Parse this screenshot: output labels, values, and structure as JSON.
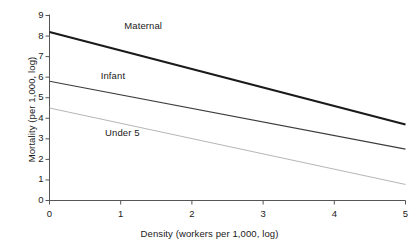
{
  "chart_data": {
    "type": "line",
    "title": "",
    "xlabel": "Density (workers per 1,000, log)",
    "ylabel": "Mortality (per 1,000, log)",
    "xlim": [
      0,
      5
    ],
    "ylim": [
      0,
      9
    ],
    "xticks": [
      "0",
      "1",
      "2",
      "3",
      "4",
      "5"
    ],
    "yticks": [
      "0",
      "1",
      "2",
      "3",
      "4",
      "5",
      "6",
      "7",
      "8",
      "9"
    ],
    "grid": false,
    "legend_position": "inline-labels",
    "x": [
      0,
      5
    ],
    "series": [
      {
        "name": "Maternal",
        "values": [
          8.2,
          3.7
        ],
        "color": "#1a1a1a",
        "width": 2.2,
        "label_x": 1.05,
        "label_y": 8.45
      },
      {
        "name": "Infant",
        "values": [
          5.8,
          2.5
        ],
        "color": "#3d3d3d",
        "width": 1.2,
        "label_x": 0.72,
        "label_y": 6.05
      },
      {
        "name": "Under 5",
        "values": [
          4.5,
          0.78
        ],
        "color": "#b6b6b6",
        "width": 1.0,
        "label_x": 0.78,
        "label_y": 3.25
      }
    ],
    "axis_color": "#555555"
  }
}
